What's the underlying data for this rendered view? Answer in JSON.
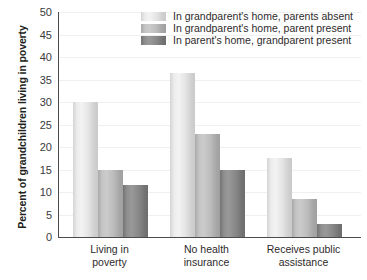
{
  "chart_data": {
    "type": "bar",
    "title": "",
    "xlabel": "",
    "ylabel": "Percent of grandchildren living in poverty",
    "ylim": [
      0,
      50
    ],
    "ytick_step": 5,
    "yticks": [
      "50",
      "45",
      "40",
      "35",
      "30",
      "25",
      "20",
      "15",
      "10",
      "5",
      "0"
    ],
    "grid": true,
    "legend_position": "top-center",
    "categories": [
      "Living in poverty",
      "No health insurance",
      "Receives public assistance"
    ],
    "category_lines": [
      [
        "Living in",
        "poverty"
      ],
      [
        "No health",
        "insurance"
      ],
      [
        "Receives public",
        "assistance"
      ]
    ],
    "series": [
      {
        "name": "In grandparent's home, parents absent",
        "color": "#ececec",
        "values": [
          30,
          36.5,
          17.5
        ]
      },
      {
        "name": "In grandparent's home, parent present",
        "color": "#bcbcbc",
        "values": [
          15,
          23,
          8.5
        ]
      },
      {
        "name": "In parent's home, grandparent present",
        "color": "#888888",
        "values": [
          11.5,
          15,
          3
        ]
      }
    ]
  },
  "axis": {
    "line_color": "#4b4b4b",
    "grid_color": "#f0f0f0"
  }
}
